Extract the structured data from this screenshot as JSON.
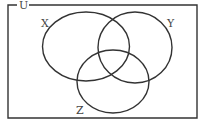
{
  "diagram": {
    "type": "venn",
    "universe": {
      "label": "U",
      "rect": {
        "x": 8,
        "y": 5,
        "width": 189,
        "height": 113
      }
    },
    "sets": [
      {
        "label": "X",
        "cx": 86,
        "cy": 46.5,
        "rx": 43.5,
        "ry": 34.5,
        "label_x": 41,
        "label_y": 27
      },
      {
        "label": "Y",
        "cx": 135,
        "cy": 47.5,
        "rx": 37,
        "ry": 35.5,
        "label_x": 167,
        "label_y": 27
      },
      {
        "label": "Z",
        "cx": 113,
        "cy": 81.5,
        "rx": 36,
        "ry": 31.5,
        "label_x": 76,
        "label_y": 114
      }
    ],
    "stroke_color": "#333333",
    "background_color": "#ffffff"
  }
}
